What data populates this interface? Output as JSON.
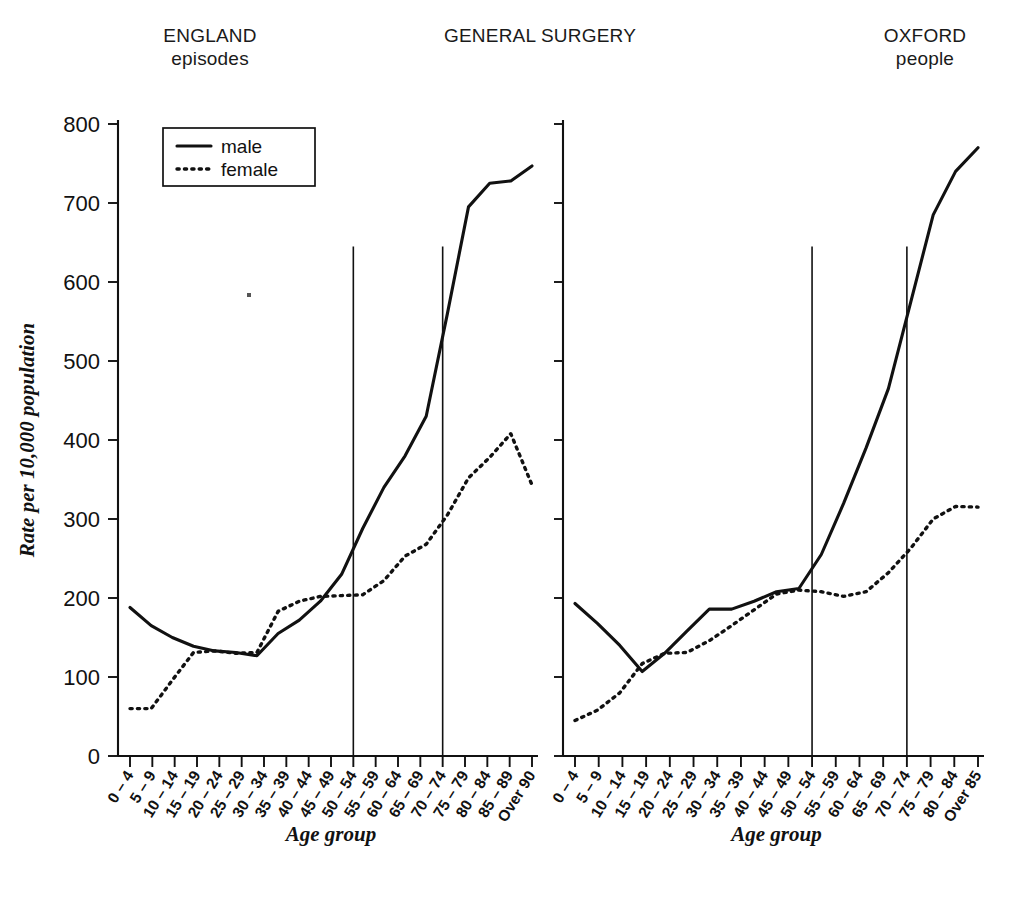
{
  "headers": {
    "left": {
      "line1": "ENGLAND",
      "line2": "episodes"
    },
    "center": {
      "line1": "GENERAL SURGERY",
      "line2": ""
    },
    "right": {
      "line1": "OXFORD",
      "line2": "people"
    }
  },
  "legend": {
    "male_label": "male",
    "female_label": "female",
    "position": "top-left-of-left-panel"
  },
  "axes": {
    "ylabel": "Rate per 10,000 population",
    "xlabel": "Age group",
    "yticks": [
      "0",
      "100",
      "200",
      "300",
      "400",
      "500",
      "600",
      "700",
      "800"
    ],
    "ylim": [
      0,
      800
    ]
  },
  "chart_data": [
    {
      "type": "line",
      "title": "ENGLAND episodes",
      "panel": "left",
      "xlabel": "Age group",
      "ylabel": "Rate per 10,000 population",
      "ylim": [
        0,
        800
      ],
      "grid": false,
      "legend": [
        "male",
        "female"
      ],
      "annotations": [
        {
          "kind": "vertical-reference-line",
          "at_category": "50 – 54",
          "top_value": 645
        },
        {
          "kind": "vertical-reference-line",
          "at_category": "70 – 74",
          "top_value": 645
        }
      ],
      "categories": [
        "0 – 4",
        "5 – 9",
        "10 – 14",
        "15 – 19",
        "20 – 24",
        "25 – 29",
        "30 – 34",
        "35 – 39",
        "40 – 44",
        "45 – 49",
        "50 – 54",
        "55 – 59",
        "60 – 64",
        "65 – 69",
        "70 – 74",
        "75 – 79",
        "80 – 84",
        "85 – 89",
        "Over 90"
      ],
      "series": [
        {
          "name": "male",
          "values": [
            188,
            165,
            150,
            139,
            133,
            131,
            127,
            155,
            172,
            196,
            230,
            288,
            340,
            380,
            430,
            560,
            695,
            725,
            728,
            747
          ]
        },
        {
          "name": "female",
          "values": [
            60,
            60,
            96,
            131,
            133,
            130,
            131,
            183,
            196,
            202,
            203,
            204,
            222,
            253,
            268,
            305,
            352,
            378,
            408,
            343
          ]
        }
      ]
    },
    {
      "type": "line",
      "title": "OXFORD people",
      "panel": "right",
      "xlabel": "Age group",
      "ylabel": "Rate per 10,000 population",
      "ylim": [
        0,
        800
      ],
      "grid": false,
      "legend": [
        "male",
        "female"
      ],
      "annotations": [
        {
          "kind": "vertical-reference-line",
          "at_category": "50 – 54",
          "top_value": 645
        },
        {
          "kind": "vertical-reference-line",
          "at_category": "70 – 74",
          "top_value": 645
        }
      ],
      "categories": [
        "0 – 4",
        "5 – 9",
        "10 – 14",
        "15 – 19",
        "20 – 24",
        "25 – 29",
        "30 – 34",
        "35 – 39",
        "40 – 44",
        "45 – 49",
        "50 – 54",
        "55 – 59",
        "60 – 64",
        "65 – 69",
        "70 – 74",
        "75 – 79",
        "80 – 84",
        "Over 85"
      ],
      "series": [
        {
          "name": "male",
          "values": [
            193,
            168,
            140,
            107,
            130,
            158,
            186,
            186,
            196,
            208,
            212,
            255,
            320,
            390,
            465,
            575,
            685,
            740,
            770
          ]
        },
        {
          "name": "female",
          "values": [
            45,
            58,
            80,
            117,
            130,
            131,
            146,
            165,
            185,
            205,
            210,
            208,
            202,
            208,
            232,
            263,
            300,
            316,
            315
          ]
        }
      ]
    }
  ],
  "note_marker": {
    "present": true,
    "description": "small ink speck"
  }
}
